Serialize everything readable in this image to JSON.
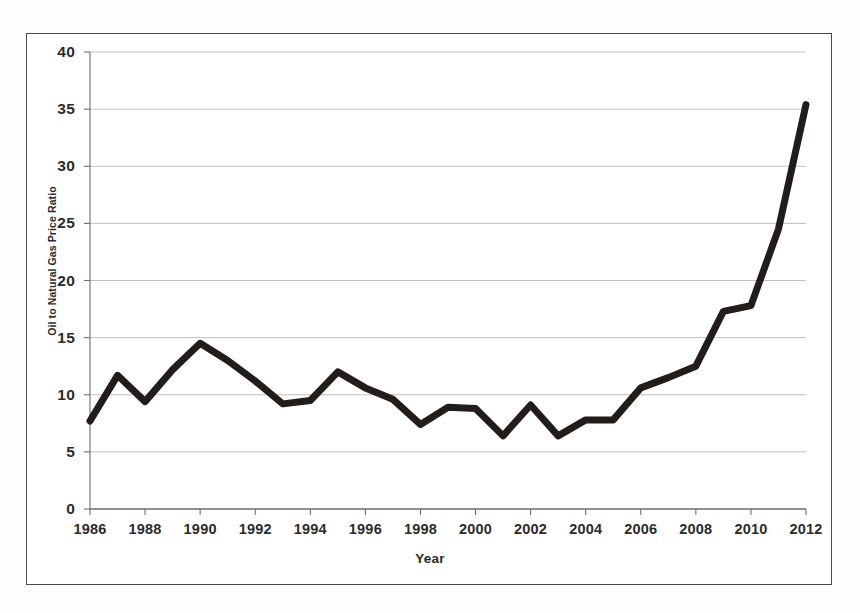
{
  "chart_data": {
    "type": "line",
    "title": "",
    "xlabel": "Year",
    "ylabel": "Oil to Natural Gas Price Ratio",
    "xlim": [
      1986,
      2012
    ],
    "ylim": [
      0,
      40
    ],
    "ytick_labels": [
      "0",
      "5",
      "10",
      "15",
      "20",
      "25",
      "30",
      "35",
      "40"
    ],
    "yticks": [
      0,
      5,
      10,
      15,
      20,
      25,
      30,
      35,
      40
    ],
    "xtick_labels": [
      "1986",
      "1988",
      "1990",
      "1992",
      "1994",
      "1996",
      "1998",
      "2000",
      "2002",
      "2004",
      "2006",
      "2008",
      "2010",
      "2012"
    ],
    "xticks": [
      1986,
      1988,
      1990,
      1992,
      1994,
      1996,
      1998,
      2000,
      2002,
      2004,
      2006,
      2008,
      2010,
      2012
    ],
    "grid": "horizontal",
    "legend": "none",
    "line_color": "#221d1a",
    "line_width": 7,
    "x": [
      1986,
      1987,
      1988,
      1989,
      1990,
      1991,
      1992,
      1993,
      1994,
      1995,
      1996,
      1997,
      1998,
      1999,
      2000,
      2001,
      2002,
      2003,
      2004,
      2005,
      2006,
      2007,
      2008,
      2009,
      2010,
      2011,
      2012
    ],
    "values": [
      7.7,
      11.7,
      9.4,
      12.2,
      14.5,
      13.0,
      11.2,
      9.2,
      9.5,
      12.0,
      10.6,
      9.6,
      7.4,
      8.9,
      8.8,
      6.4,
      9.1,
      6.4,
      7.8,
      7.8,
      10.6,
      11.5,
      12.5,
      17.3,
      17.8,
      24.5,
      35.4
    ],
    "series": [
      {
        "name": "Oil to Natural Gas Price Ratio",
        "values": [
          7.7,
          11.7,
          9.4,
          12.2,
          14.5,
          13.0,
          11.2,
          9.2,
          9.5,
          12.0,
          10.6,
          9.6,
          7.4,
          8.9,
          8.8,
          6.4,
          9.1,
          6.4,
          7.8,
          7.8,
          10.6,
          11.5,
          12.5,
          17.3,
          17.8,
          24.5,
          35.4
        ]
      }
    ]
  },
  "colors": {
    "line": "#221d1a",
    "gridline": "#b9b9b9",
    "axis": "#6d6d6d",
    "frame": "#4a4a4a",
    "text": "#2b2b2b",
    "background": "#ffffff"
  }
}
